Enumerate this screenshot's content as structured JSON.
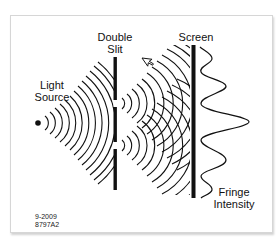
{
  "labels": {
    "light_source_line1": "Light",
    "light_source_line2": "Source",
    "double_slit_line1": "Double",
    "double_slit_line2": "Slit",
    "screen": "Screen",
    "fringe_line1": "Fringe",
    "fringe_line2": "Intensity"
  },
  "figure_id": {
    "date": "9-2009",
    "code": "8797A2"
  },
  "colors": {
    "ink": "#111111",
    "background": "#ffffff",
    "frame_border": "#d6d6d6"
  },
  "geometry": {
    "source": {
      "x": 38,
      "y": 123
    },
    "slit_bar": {
      "x": 115,
      "y_top": 57,
      "y_bottom": 190,
      "slits_y": [
        103,
        145
      ]
    },
    "screen_bar": {
      "x": 193,
      "y_top": 45,
      "y_bottom": 198
    },
    "fringe_peaks_y": [
      57,
      86,
      122,
      160,
      190
    ]
  }
}
